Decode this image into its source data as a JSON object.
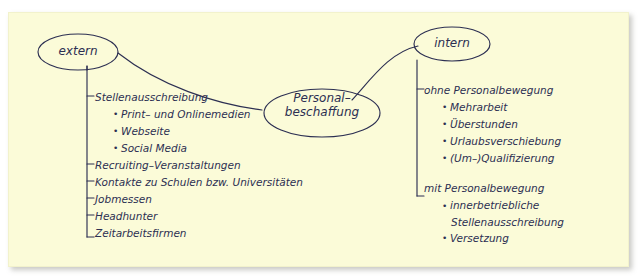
{
  "card": {
    "background_color": "#fbfbd8",
    "ink_color": "#2c2f52"
  },
  "diagram": {
    "type": "mind-map",
    "nodes": {
      "center": {
        "line1": "Personal–",
        "line2": "beschaffung"
      },
      "left": {
        "label": "extern"
      },
      "right": {
        "label": "intern"
      }
    },
    "branches": {
      "extern": {
        "items": [
          {
            "level": 1,
            "text": "Stellenausschreibung",
            "bullet": "dash"
          },
          {
            "level": 2,
            "text": "Print– und Onlinemedien",
            "bullet": "dot"
          },
          {
            "level": 2,
            "text": "Webseite",
            "bullet": "dot"
          },
          {
            "level": 2,
            "text": "Social Media",
            "bullet": "dot"
          },
          {
            "level": 1,
            "text": "Recruiting–Veranstaltungen",
            "bullet": "dash"
          },
          {
            "level": 1,
            "text": "Kontakte zu Schulen bzw. Universitäten",
            "bullet": "dash"
          },
          {
            "level": 1,
            "text": "Jobmessen",
            "bullet": "dash"
          },
          {
            "level": 1,
            "text": "Headhunter",
            "bullet": "dash"
          },
          {
            "level": 1,
            "text": "Zeitarbeitsfirmen",
            "bullet": "dash"
          }
        ]
      },
      "intern": {
        "groups": [
          {
            "heading": "ohne Personalbewegung",
            "items": [
              "Mehrarbeit",
              "Überstunden",
              "Urlaubsverschiebung",
              "(Um–)Qualifizierung"
            ]
          },
          {
            "heading": "mit Personalbewegung",
            "items": [
              "innerbetriebliche Stellenausschreibung",
              "Versetzung"
            ]
          }
        ]
      }
    }
  }
}
